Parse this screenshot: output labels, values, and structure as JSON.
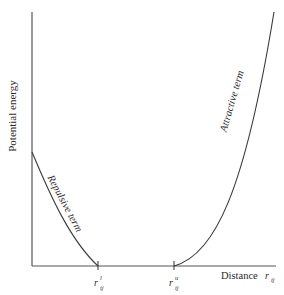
{
  "diagram": {
    "y_axis_label": "Potential energy",
    "x_axis_label": "Distance",
    "x_axis_symbol": "r",
    "x_axis_symbol_sub": "ij",
    "ticks": [
      {
        "symbol": "r",
        "sup": "l",
        "sub": "ij"
      },
      {
        "symbol": "r",
        "sup": "u",
        "sub": "ij"
      }
    ],
    "curves": [
      {
        "name": "repulsive",
        "label": "Repulsive term"
      },
      {
        "name": "attractive",
        "label": "Attractive term"
      }
    ],
    "colors": {
      "line": "#3a3a3a",
      "axis": "#555555",
      "text": "#2a2a2a"
    }
  }
}
